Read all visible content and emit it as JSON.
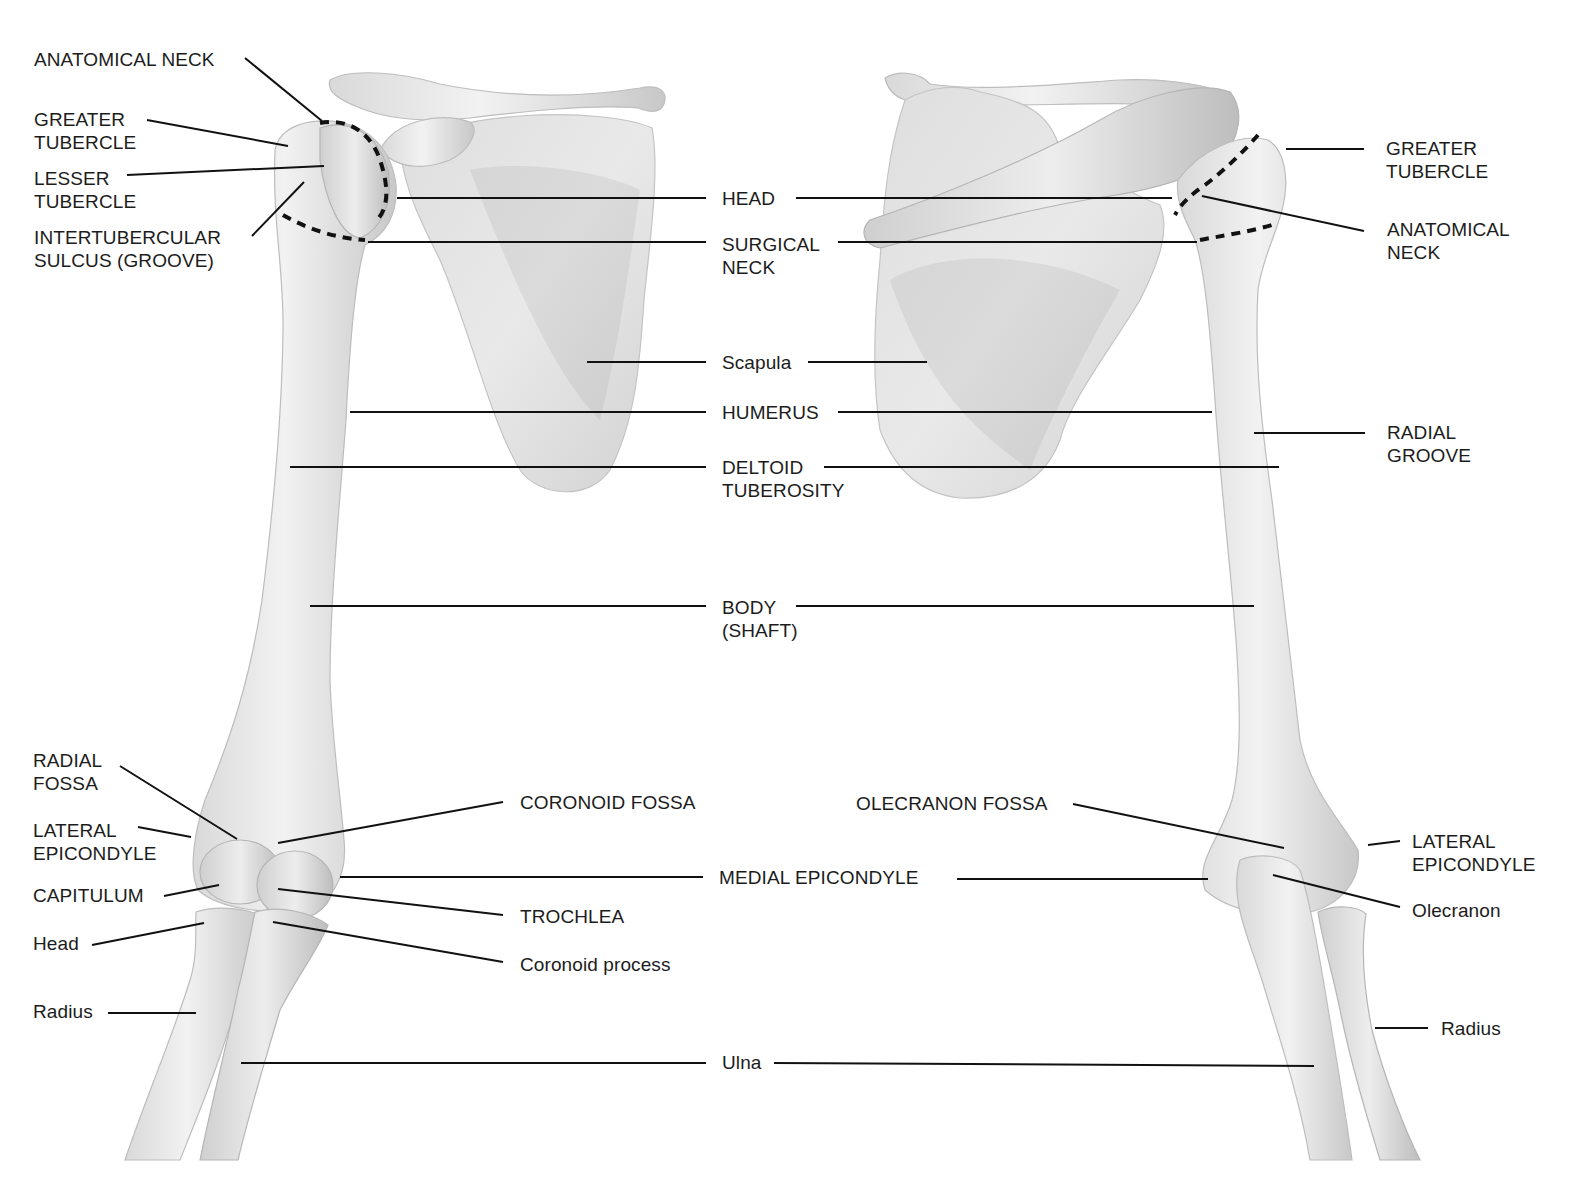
{
  "figure": {
    "views": [
      "anterior (left)",
      "posterior (right)"
    ],
    "colors": {
      "background": "#ffffff",
      "bone": "#e6e6e6",
      "bone_shadow": "#b0b0b0",
      "text": "#1c1c1c",
      "leader": "#111111"
    }
  },
  "labels": {
    "left": {
      "anatomical_neck": "ANATOMICAL NECK",
      "greater_tubercle": "GREATER\nTUBERCLE",
      "lesser_tubercle": "LESSER\nTUBERCLE",
      "intertubercular": "INTERTUBERCULAR\nSULCUS (GROOVE)",
      "radial_fossa": "RADIAL\nFOSSA",
      "lateral_epicondyle": "LATERAL\nEPICONDYLE",
      "capitulum": "CAPITULUM",
      "head": "Head",
      "radius": "Radius"
    },
    "center": {
      "head": "HEAD",
      "surgical_neck": "SURGICAL\nNECK",
      "scapula": "Scapula",
      "humerus": "HUMERUS",
      "deltoid_tuberosity": "DELTOID\nTUBEROSITY",
      "body": "BODY\n(SHAFT)",
      "coronoid_fossa": "CORONOID FOSSA",
      "olecranon_fossa": "OLECRANON FOSSA",
      "medial_epicondyle": "MEDIAL EPICONDYLE",
      "trochlea": "TROCHLEA",
      "coronoid_process": "Coronoid process",
      "ulna": "Ulna"
    },
    "right": {
      "greater_tubercle": "GREATER\nTUBERCLE",
      "anatomical_neck": "ANATOMICAL\nNECK",
      "radial_groove": "RADIAL\nGROOVE",
      "lateral_epicondyle": "LATERAL\nEPICONDYLE",
      "olecranon": "Olecranon",
      "radius": "Radius"
    }
  }
}
